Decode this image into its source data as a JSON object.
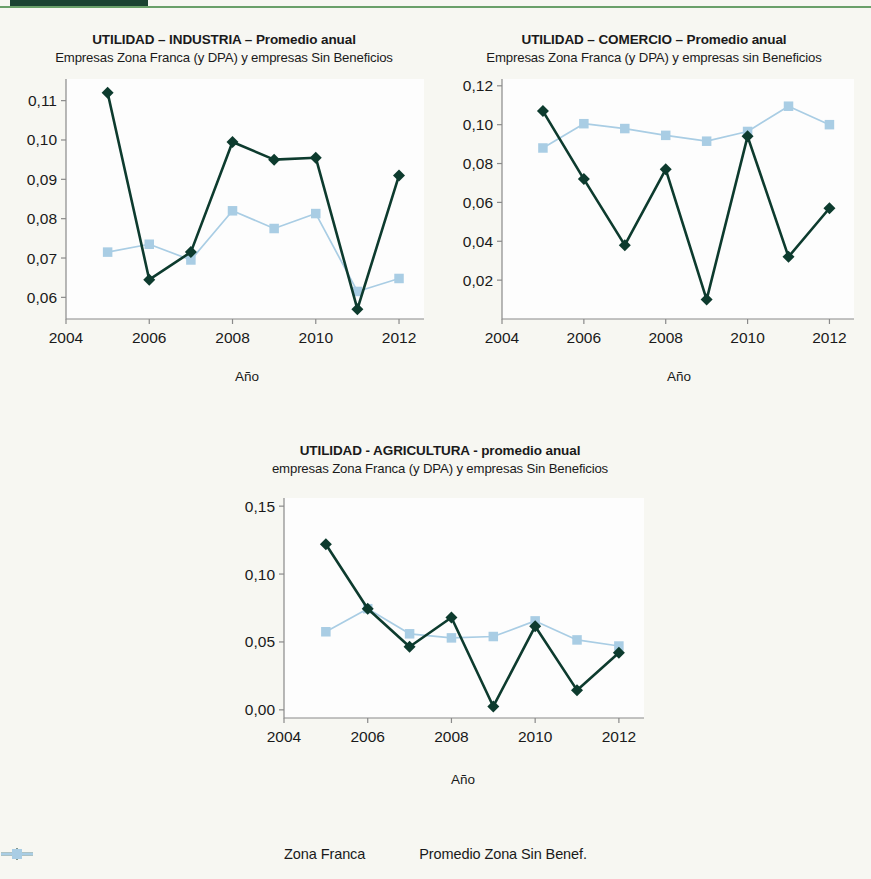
{
  "decor": {
    "rule_dark_color": "#1b4332",
    "rule_light_color": "#6aa06a"
  },
  "series_colors": {
    "zona_franca": "#0d3b2e",
    "sin_beneficios": "#a9cde4"
  },
  "legend": {
    "items": [
      {
        "label": "Zona Franca",
        "marker": "diamond-marker",
        "color": "#0d3b2e"
      },
      {
        "label": "Promedio Zona Sin Benef.",
        "marker": "square-marker",
        "color": "#a9cde4"
      }
    ]
  },
  "chart_data": [
    {
      "id": "industria",
      "type": "line",
      "title": "UTILIDAD – INDUSTRIA – Promedio anual",
      "subtitle": "Empresas Zona Franca (y DPA) y empresas Sin Beneficios",
      "xlabel": "Año",
      "ylabel": "",
      "x": [
        2005,
        2006,
        2007,
        2008,
        2009,
        2010,
        2011,
        2012
      ],
      "xlim": [
        2004,
        2012.6
      ],
      "xticks": [
        2004,
        2006,
        2008,
        2010,
        2012
      ],
      "xticklabels": [
        "2004",
        "2006",
        "2008",
        "2010",
        "2012"
      ],
      "ylim": [
        0.0545,
        0.1155
      ],
      "yticks": [
        0.06,
        0.07,
        0.08,
        0.09,
        0.1,
        0.11
      ],
      "yticklabels": [
        "0,06",
        "0,07",
        "0,08",
        "0,09",
        "0,10",
        "0,11"
      ],
      "grid": false,
      "legend_position": "bottom",
      "series": [
        {
          "name": "Zona Franca",
          "values": [
            0.112,
            0.0645,
            0.0715,
            0.0995,
            0.095,
            0.0955,
            0.057,
            0.091
          ]
        },
        {
          "name": "Promedio Zona Sin Benef.",
          "values": [
            0.0715,
            0.0735,
            0.0695,
            0.082,
            0.0775,
            0.0813,
            0.0615,
            0.0648
          ]
        }
      ]
    },
    {
      "id": "comercio",
      "type": "line",
      "title": "UTILIDAD – COMERCIO – Promedio anual",
      "subtitle": "Empresas Zona Franca (y DPA) y empresas sin Beneficios",
      "xlabel": "Año",
      "ylabel": "",
      "x": [
        2005,
        2006,
        2007,
        2008,
        2009,
        2010,
        2011,
        2012
      ],
      "xlim": [
        2004,
        2012.6
      ],
      "xticks": [
        2004,
        2006,
        2008,
        2010,
        2012
      ],
      "xticklabels": [
        "2004",
        "2006",
        "2008",
        "2010",
        "2012"
      ],
      "ylim": [
        0.0,
        0.1235
      ],
      "yticks": [
        0.02,
        0.04,
        0.06,
        0.08,
        0.1,
        0.12
      ],
      "yticklabels": [
        "0,02",
        "0,04",
        "0,06",
        "0,08",
        "0,10",
        "0,12"
      ],
      "grid": false,
      "legend_position": "bottom",
      "series": [
        {
          "name": "Zona Franca",
          "values": [
            0.107,
            0.072,
            0.038,
            0.077,
            0.01,
            0.094,
            0.032,
            0.057
          ]
        },
        {
          "name": "Promedio Zona Sin Benef.",
          "values": [
            0.088,
            0.1005,
            0.098,
            0.0945,
            0.0915,
            0.0965,
            0.1095,
            0.1
          ]
        }
      ]
    },
    {
      "id": "agricultura",
      "type": "line",
      "title": "UTILIDAD - AGRICULTURA - promedio anual",
      "subtitle": "empresas Zona Franca (y DPA) y empresas Sin Beneficios",
      "xlabel": "Año",
      "ylabel": "",
      "x": [
        2005,
        2006,
        2007,
        2008,
        2009,
        2010,
        2011,
        2012
      ],
      "xlim": [
        2004,
        2012.6
      ],
      "xticks": [
        2004,
        2006,
        2008,
        2010,
        2012
      ],
      "xticklabels": [
        "2004",
        "2006",
        "2008",
        "2010",
        "2012"
      ],
      "ylim": [
        -0.006,
        0.156
      ],
      "yticks": [
        0.0,
        0.05,
        0.1,
        0.15
      ],
      "yticklabels": [
        "0,00",
        "0,05",
        "0,10",
        "0,15"
      ],
      "grid": false,
      "legend_position": "bottom",
      "series": [
        {
          "name": "Zona Franca",
          "values": [
            0.122,
            0.0745,
            0.0465,
            0.068,
            0.0025,
            0.0615,
            0.0145,
            0.042
          ]
        },
        {
          "name": "Promedio Zona Sin Benef.",
          "values": [
            0.0575,
            0.0745,
            0.056,
            0.053,
            0.054,
            0.0655,
            0.0515,
            0.047
          ]
        }
      ]
    }
  ]
}
